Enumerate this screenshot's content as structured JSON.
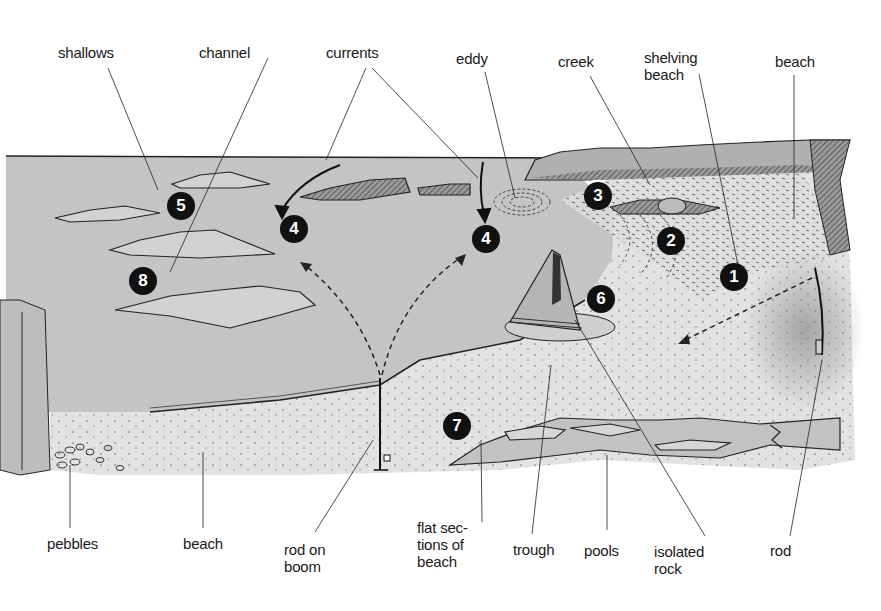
{
  "diagram": {
    "title_cut_off": true,
    "top_labels": [
      {
        "id": "shallows",
        "text": "shallows",
        "x": 58,
        "y": 44
      },
      {
        "id": "channel",
        "text": "channel",
        "x": 199,
        "y": 44
      },
      {
        "id": "currents",
        "text": "currents",
        "x": 326,
        "y": 44
      },
      {
        "id": "eddy",
        "text": "eddy",
        "x": 456,
        "y": 50
      },
      {
        "id": "creek",
        "text": "creek",
        "x": 558,
        "y": 53
      },
      {
        "id": "shelving-beach",
        "text": "shelving\nbeach",
        "x": 644,
        "y": 49
      },
      {
        "id": "beach-top",
        "text": "beach",
        "x": 775,
        "y": 53
      }
    ],
    "bottom_labels": [
      {
        "id": "pebbles",
        "text": "pebbles",
        "x": 47,
        "y": 535
      },
      {
        "id": "beach-bottom",
        "text": "beach",
        "x": 183,
        "y": 535
      },
      {
        "id": "rod-on-boom",
        "text": "rod on\nboom",
        "x": 284,
        "y": 541
      },
      {
        "id": "flat-sections",
        "text": "flat sec-\ntions of\nbeach",
        "x": 417,
        "y": 519
      },
      {
        "id": "trough",
        "text": "trough",
        "x": 513,
        "y": 541
      },
      {
        "id": "pools",
        "text": "pools",
        "x": 584,
        "y": 542
      },
      {
        "id": "isolated-rock",
        "text": "isolated\nrock",
        "x": 654,
        "y": 543
      },
      {
        "id": "rod",
        "text": "rod",
        "x": 770,
        "y": 542
      }
    ],
    "markers": [
      {
        "n": "1",
        "x": 734,
        "y": 277
      },
      {
        "n": "2",
        "x": 671,
        "y": 241
      },
      {
        "n": "3",
        "x": 598,
        "y": 196
      },
      {
        "n": "4",
        "x": 294,
        "y": 229
      },
      {
        "n": "4",
        "x": 486,
        "y": 239
      },
      {
        "n": "5",
        "x": 181,
        "y": 206
      },
      {
        "n": "6",
        "x": 601,
        "y": 299
      },
      {
        "n": "7",
        "x": 457,
        "y": 426
      },
      {
        "n": "8",
        "x": 143,
        "y": 281
      }
    ],
    "colors": {
      "sea": "#c4c4c4",
      "sand": "#e2e2e2",
      "rock": "#b8b8b8",
      "ink": "#1a1a1a",
      "marker_bg": "#111111",
      "marker_fg": "#ffffff"
    }
  }
}
